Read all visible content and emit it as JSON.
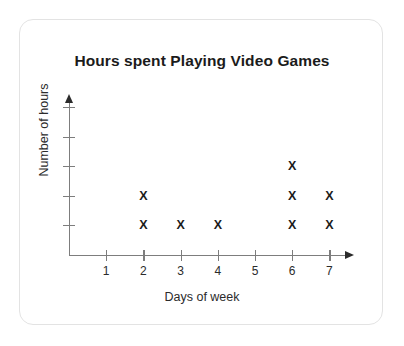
{
  "card": {
    "name": "chart-card"
  },
  "chart_data": {
    "type": "scatter",
    "plot_style": "dot-plot",
    "title": "Hours spent Playing Video Games",
    "xlabel": "Days of week",
    "ylabel": "Number of hours",
    "marker": "X",
    "categories": [
      "1",
      "2",
      "3",
      "4",
      "5",
      "6",
      "7"
    ],
    "x": [
      1,
      2,
      3,
      4,
      5,
      6,
      7
    ],
    "values": [
      0,
      2,
      1,
      1,
      0,
      3,
      2
    ],
    "points": [
      {
        "x": 2,
        "y": 1
      },
      {
        "x": 2,
        "y": 2
      },
      {
        "x": 3,
        "y": 1
      },
      {
        "x": 4,
        "y": 1
      },
      {
        "x": 6,
        "y": 1
      },
      {
        "x": 6,
        "y": 2
      },
      {
        "x": 6,
        "y": 3
      },
      {
        "x": 7,
        "y": 1
      },
      {
        "x": 7,
        "y": 2
      }
    ],
    "xlim": [
      0,
      7.6
    ],
    "ylim": [
      0,
      5
    ],
    "y_ticks": [
      1,
      2,
      3,
      4,
      5
    ],
    "y_tick_labels": [
      "",
      "",
      "",
      "",
      ""
    ],
    "x_tick_labels": [
      "1",
      "2",
      "3",
      "4",
      "5",
      "6",
      "7"
    ],
    "grid": false,
    "legend": false,
    "axis_arrows": true,
    "colors": {
      "axis": "#7d7d7d",
      "marker": "#1b1b1b",
      "text": "#2b2b2b",
      "title": "#1b1b1b",
      "card_border": "#e3e3e3",
      "background": "#ffffff"
    }
  }
}
